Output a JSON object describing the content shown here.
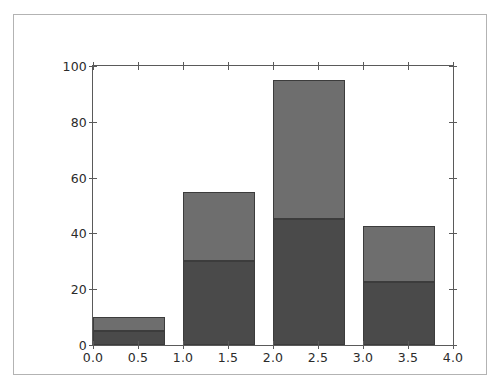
{
  "chart_data": {
    "type": "bar",
    "title": "",
    "subtitle": "",
    "xlabel": "",
    "ylabel": "",
    "xlim": [
      0.0,
      4.0
    ],
    "ylim": [
      0,
      100
    ],
    "grid": false,
    "legend": false,
    "legend_position": "none",
    "stacked": true,
    "bar_width": 0.8,
    "bar_align": "edge",
    "x": [
      0.0,
      1.0,
      2.0,
      3.0
    ],
    "categories": [
      "0.0",
      "1.0",
      "2.0",
      "3.0"
    ],
    "series": [
      {
        "name": "lower",
        "color": "#4a4a4a",
        "values": [
          5,
          30,
          45,
          22.5
        ]
      },
      {
        "name": "upper",
        "color": "#6e6e6e",
        "values": [
          5,
          25,
          50,
          20
        ]
      }
    ],
    "totals": [
      10,
      55,
      95,
      42.5
    ],
    "xticks": [
      0.0,
      0.5,
      1.0,
      1.5,
      2.0,
      2.5,
      3.0,
      3.5,
      4.0
    ],
    "xticklabels": [
      "0.0",
      "0.5",
      "1.0",
      "1.5",
      "2.0",
      "2.5",
      "3.0",
      "3.5",
      "4.0"
    ],
    "yticks": [
      0,
      20,
      40,
      60,
      80,
      100
    ],
    "yticklabels": [
      "0",
      "20",
      "40",
      "60",
      "80",
      "100"
    ],
    "edge_color": "#3c3c3c",
    "axis_color": "#5a5a5a",
    "tick_label_color": "#2b2b2b",
    "background_color": "#ffffff",
    "frame_color": "#b3b3b3"
  }
}
